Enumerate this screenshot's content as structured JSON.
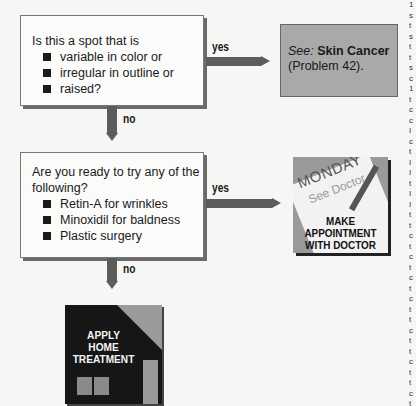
{
  "flowchart": {
    "question1": {
      "intro": "Is this a spot that is",
      "bullets": [
        "variable in color or",
        "irregular in outline or",
        "raised?"
      ]
    },
    "question1_yes_label": "yes",
    "question1_no_label": "no",
    "reference": {
      "see": "See:",
      "topic": "Skin Cancer",
      "problem": "(Problem 42)."
    },
    "question2": {
      "intro_line1": "Are you ready to try any of the",
      "intro_line2": "following?",
      "bullets": [
        "Retin-A for wrinkles",
        "Minoxidil for baldness",
        "Plastic surgery"
      ]
    },
    "question2_yes_label": "yes",
    "question2_no_label": "no",
    "appointment_icon": {
      "day": "MONDAY",
      "note": "See Doctor",
      "caption_line1": "MAKE",
      "caption_line2": "APPOINTMENT",
      "caption_line3": "WITH DOCTOR"
    },
    "home_icon": {
      "caption_line1": "APPLY",
      "caption_line2": "HOME",
      "caption_line3": "TREATMENT"
    }
  },
  "clipped_edge_text": "1\ns\nt\ns\nt\nt\ns\nc\n1\nt\nc\nc\nI\nc\nt\nI\nI\nt\nI\nI\nt\nt\nc\nt\nc\nt\nc\nt\nc\nt\nt\nc\nt\nt\nc\nt\nt\nc\nt"
}
